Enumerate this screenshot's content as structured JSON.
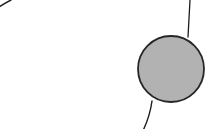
{
  "canvas": {
    "width": 219,
    "height": 129,
    "background_color": "#ffffff",
    "description": "geometric line drawing: large open circular arc with a small filled gray disc tangent at the lower right and a thin near-vertical line from the top edge to the disc"
  },
  "palette": {
    "background": "#ffffff",
    "stroke": "#1c1c1c",
    "disc_fill": "#b2b2b2",
    "disc_stroke": "#262626"
  },
  "shapes": {
    "large_arc": {
      "name": "large-arc",
      "kind": "arc",
      "center_x": 101,
      "center_y": 24,
      "radius": 98,
      "start_x": 11,
      "start_y": 0,
      "end_x": 152,
      "end_y": 101,
      "leftmost_x": 4,
      "leftmost_y": 44,
      "bottom_x": 100,
      "bottom_y": 122,
      "stroke_width": 1.4,
      "fill": "none"
    },
    "gray_disc": {
      "name": "gray-disc",
      "kind": "circle",
      "center_x": 171,
      "center_y": 69,
      "radius": 33,
      "diameter": 66,
      "left_x": 138,
      "right_x": 204,
      "top_y": 36,
      "bottom_y": 102,
      "fill": "#b2b2b2",
      "stroke_width": 1.8
    },
    "tangent_line": {
      "name": "tangent-line",
      "kind": "line",
      "start_x": 190,
      "start_y": 0,
      "end_x": 188,
      "end_y": 37,
      "stroke_width": 1.3
    }
  }
}
